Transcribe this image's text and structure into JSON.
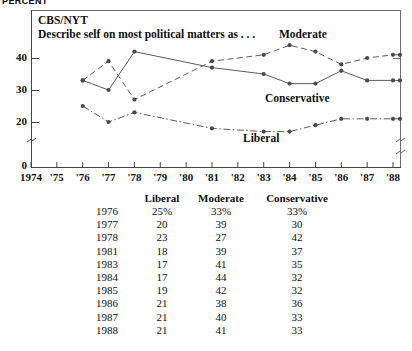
{
  "axis_unit_label": "PERCENT",
  "plot": {
    "source": "CBS/NYT",
    "description": "Describe self on most political matters as . . .",
    "series_labels": {
      "moderate": "Moderate",
      "conservative": "Conservative",
      "liberal": "Liberal"
    }
  },
  "table": {
    "headers": {
      "year": "",
      "liberal": "Liberal",
      "moderate": "Moderate",
      "conservative": "Conservative"
    },
    "rows": [
      {
        "year": "1976",
        "liberal": "25%",
        "moderate": "33%",
        "conservative": "33%"
      },
      {
        "year": "1977",
        "liberal": "20",
        "moderate": "39",
        "conservative": "30"
      },
      {
        "year": "1978",
        "liberal": "23",
        "moderate": "27",
        "conservative": "42"
      },
      {
        "year": "1981",
        "liberal": "18",
        "moderate": "39",
        "conservative": "37"
      },
      {
        "year": "1983",
        "liberal": "17",
        "moderate": "41",
        "conservative": "35"
      },
      {
        "year": "1984",
        "liberal": "17",
        "moderate": "44",
        "conservative": "32"
      },
      {
        "year": "1985",
        "liberal": "19",
        "moderate": "42",
        "conservative": "32"
      },
      {
        "year": "1986",
        "liberal": "21",
        "moderate": "38",
        "conservative": "36"
      },
      {
        "year": "1987",
        "liberal": "21",
        "moderate": "40",
        "conservative": "33"
      },
      {
        "year": "1988",
        "liberal": "21",
        "moderate": "41",
        "conservative": "33"
      }
    ]
  },
  "chart_data": {
    "type": "line",
    "title": "CBS/NYT",
    "subtitle": "Describe self on most political matters as . . .",
    "xlabel": "",
    "ylabel": "PERCENT",
    "x": [
      1976,
      1977,
      1978,
      1981,
      1983,
      1984,
      1985,
      1986,
      1987,
      1988
    ],
    "x_tick_labels": [
      "1974",
      "'75",
      "'76",
      "'77",
      "'78",
      "'79",
      "'80",
      "'81",
      "'82",
      "'83",
      "'84",
      "'85",
      "'86",
      "'87",
      "'88"
    ],
    "x_tick_values": [
      1974,
      1975,
      1976,
      1977,
      1978,
      1979,
      1980,
      1981,
      1982,
      1983,
      1984,
      1985,
      1986,
      1987,
      1988
    ],
    "xlim": [
      1974,
      1988
    ],
    "y_tick_labels": [
      "0",
      "20",
      "30",
      "40"
    ],
    "y_tick_values": [
      0,
      20,
      30,
      40
    ],
    "ylim": [
      0,
      46
    ],
    "y_axis_break": true,
    "y_axis_break_between": [
      0,
      20
    ],
    "grid": false,
    "legend": "inline-annotations",
    "series": [
      {
        "name": "Moderate",
        "style": "dashed",
        "marker": "circle",
        "values": [
          33,
          39,
          27,
          39,
          41,
          44,
          42,
          38,
          40,
          41
        ]
      },
      {
        "name": "Conservative",
        "style": "solid",
        "marker": "circle",
        "values": [
          33,
          30,
          42,
          37,
          35,
          32,
          32,
          36,
          33,
          33
        ]
      },
      {
        "name": "Liberal",
        "style": "dash-dot",
        "marker": "circle",
        "values": [
          25,
          20,
          23,
          18,
          17,
          17,
          19,
          21,
          21,
          21
        ]
      }
    ]
  }
}
